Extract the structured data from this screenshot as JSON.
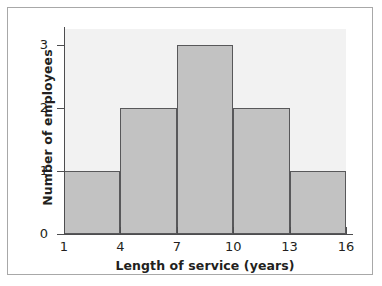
{
  "figure": {
    "frame_border_color": "#a8a8a8",
    "background_color": "#ffffff"
  },
  "chart_data": {
    "type": "bar",
    "subtype": "histogram",
    "title": "",
    "xlabel": "Length of service (years)",
    "ylabel": "Number of employees",
    "categories": [
      "1-4",
      "4-7",
      "7-10",
      "10-13",
      "13-16"
    ],
    "bin_edges": [
      1,
      4,
      7,
      10,
      13,
      16
    ],
    "values": [
      1,
      2,
      3,
      2,
      1
    ],
    "x_tick_labels": [
      "1",
      "4",
      "7",
      "10",
      "13",
      "16"
    ],
    "y_tick_labels": [
      "0",
      "1",
      "2",
      "3"
    ],
    "xlim": [
      1,
      16
    ],
    "ylim": [
      0,
      3.25
    ],
    "grid": false,
    "legend": false,
    "bar_fill_color": "#c2c2c2",
    "bar_edge_color": "#58585a",
    "plot_background_color": "#f2f2f2",
    "axis_color": "#4d4d4f"
  }
}
